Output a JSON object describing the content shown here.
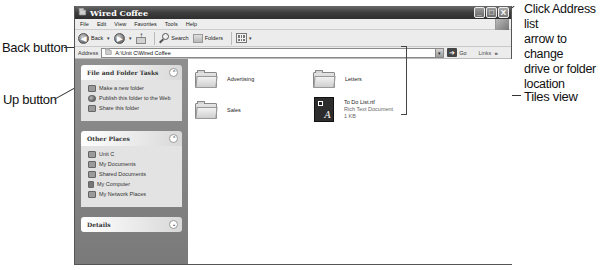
{
  "window": {
    "title": "Wired Coffee",
    "menu": [
      "File",
      "Edit",
      "View",
      "Favorites",
      "Tools",
      "Help"
    ],
    "controls": {
      "minimize": "_",
      "maximize": "□",
      "close": "X"
    }
  },
  "toolbar": {
    "back_label": "Back",
    "back_icon": "◀",
    "forward_icon": "▶",
    "dropdown": "▾",
    "search_label": "Search",
    "folders_label": "Folders"
  },
  "addressbar": {
    "label": "Address",
    "value": "A:\\Unit C\\Wired Coffee",
    "dropdown": "▾",
    "go_label": "Go",
    "go_icon": "➔",
    "links_label": "Links",
    "chevron": "»"
  },
  "sidebar": {
    "panels": [
      {
        "title": "File and Folder Tasks",
        "toggle": "⌃",
        "items": [
          "Make a new folder",
          "Publish this folder to the Web",
          "Share this folder"
        ]
      },
      {
        "title": "Other Places",
        "toggle": "⌃",
        "items": [
          "Unit C",
          "My Documents",
          "Shared Documents",
          "My Computer",
          "My Network Places"
        ]
      },
      {
        "title": "Details",
        "toggle": "⌄",
        "items": []
      }
    ]
  },
  "content": {
    "view": "Tiles",
    "items": [
      {
        "name": "Advertising",
        "type": "folder"
      },
      {
        "name": "Letters",
        "type": "folder"
      },
      {
        "name": "Sales",
        "type": "folder"
      },
      {
        "name": "To Do List.rtf",
        "type": "Rich Text Document",
        "size": "1 KB"
      }
    ]
  },
  "callouts": {
    "back": "Back button",
    "up": "Up button",
    "address": [
      "Click Address list",
      "arrow to change",
      "drive or folder",
      "location"
    ],
    "tiles": "Tiles view"
  }
}
